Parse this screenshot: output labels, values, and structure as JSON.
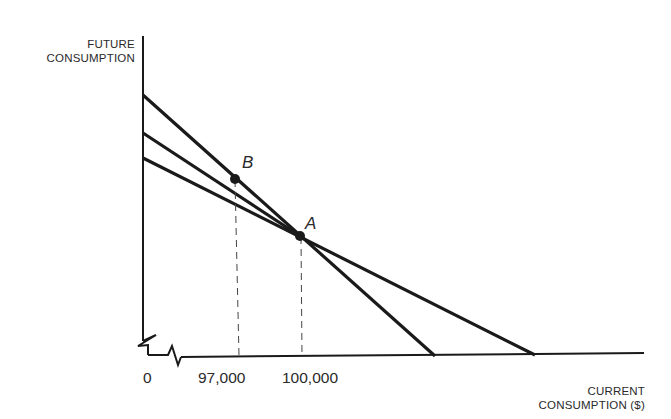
{
  "diagram": {
    "y_axis_label_line1": "FUTURE",
    "y_axis_label_line2": "CONSUMPTION",
    "x_axis_label_line1": "CURRENT",
    "x_axis_label_line2": "CONSUMPTION ($)",
    "origin_label": "0",
    "x_ticks": [
      "97,000",
      "100,000"
    ],
    "points": [
      {
        "label": "B",
        "x_value": "97,000"
      },
      {
        "label": "A",
        "x_value": "100,000"
      }
    ],
    "lines": [
      {
        "name": "steep-budget-line",
        "through": [
          "B",
          "A"
        ]
      },
      {
        "name": "middle-line",
        "through": [
          "B"
        ]
      },
      {
        "name": "flat-budget-line",
        "through": [
          "A"
        ]
      }
    ],
    "axis_break": true,
    "line_color": "#1a1a1a"
  }
}
